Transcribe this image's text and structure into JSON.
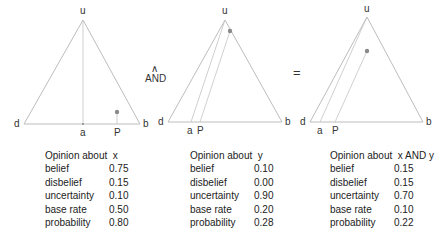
{
  "diagram": {
    "operator": {
      "symbol": "∧",
      "label": "AND"
    },
    "equals": "=",
    "vertex_labels": {
      "top": "u",
      "left": "d",
      "right": "b",
      "base_rate": "a",
      "projection": "P"
    },
    "triangles": [
      {
        "id": "x",
        "apex": [
          83,
          20
        ],
        "left": [
          24,
          124
        ],
        "right": [
          140,
          124
        ],
        "a_x": 83,
        "p_x": 117,
        "point": [
          117,
          112
        ]
      },
      {
        "id": "y",
        "apex": [
          225,
          20
        ],
        "left": [
          168,
          122
        ],
        "right": [
          282,
          122
        ],
        "a_x": 191,
        "p_x": 200,
        "point": [
          230,
          31
        ]
      },
      {
        "id": "xy",
        "apex": [
          367,
          17
        ],
        "left": [
          310,
          122
        ],
        "right": [
          423,
          122
        ],
        "a_x": 320,
        "p_x": 335,
        "point": [
          367,
          51
        ]
      }
    ]
  },
  "tables": [
    {
      "title": "Opinion about  x",
      "rows": [
        {
          "label": "belief",
          "value": "0.75"
        },
        {
          "label": "disbelief",
          "value": "0.15"
        },
        {
          "label": "uncertainty",
          "value": "0.10"
        },
        {
          "label": "base rate",
          "value": "0.50"
        },
        {
          "label": "probability",
          "value": "0.80"
        }
      ]
    },
    {
      "title": "Opinion about  y",
      "rows": [
        {
          "label": "belief",
          "value": "0.10"
        },
        {
          "label": "disbelief",
          "value": "0.00"
        },
        {
          "label": "uncertainty",
          "value": "0.90"
        },
        {
          "label": "base rate",
          "value": "0.20"
        },
        {
          "label": "probability",
          "value": "0.28"
        }
      ]
    },
    {
      "title": "Opinion about  x AND y",
      "rows": [
        {
          "label": "belief",
          "value": "0.15"
        },
        {
          "label": "disbelief",
          "value": "0.15"
        },
        {
          "label": "uncertainty",
          "value": "0.70"
        },
        {
          "label": "base rate",
          "value": "0.10"
        },
        {
          "label": "probability",
          "value": "0.22"
        }
      ]
    }
  ]
}
